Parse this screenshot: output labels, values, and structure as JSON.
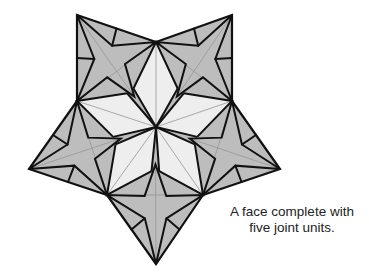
{
  "caption": {
    "line1": "A face complete with",
    "line2": "five joint units."
  },
  "colors": {
    "gray_fill": "#bdbdbd",
    "light_fill": "#eeeeee",
    "stroke": "#111111",
    "thin_line": "#8a8a8a"
  },
  "geometry": {
    "center": [
      156,
      127
    ],
    "outer_tips": [
      [
        77,
        15
      ],
      [
        232,
        15
      ],
      [
        280,
        169
      ],
      [
        156,
        264
      ],
      [
        29,
        169
      ]
    ],
    "inner_vertices": [
      [
        156,
        42
      ],
      [
        232,
        101
      ],
      [
        203,
        195
      ],
      [
        107,
        195
      ],
      [
        77,
        101
      ]
    ],
    "arms": [
      {
        "tip": [
          77,
          15
        ],
        "a": [
          156,
          42
        ],
        "b": [
          77,
          101
        ]
      },
      {
        "tip": [
          232,
          15
        ],
        "a": [
          232,
          101
        ],
        "b": [
          156,
          42
        ]
      },
      {
        "tip": [
          280,
          169
        ],
        "a": [
          203,
          195
        ],
        "b": [
          232,
          101
        ]
      },
      {
        "tip": [
          156,
          264
        ],
        "a": [
          107,
          195
        ],
        "b": [
          203,
          195
        ]
      },
      {
        "tip": [
          29,
          169
        ],
        "a": [
          77,
          101
        ],
        "b": [
          107,
          195
        ]
      }
    ]
  }
}
